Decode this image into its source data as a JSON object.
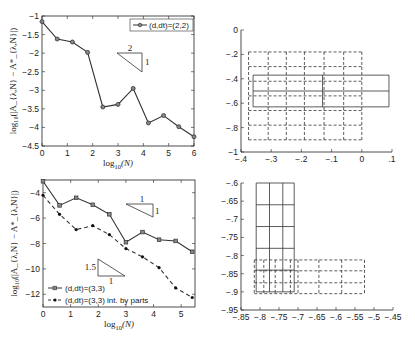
{
  "chart_data": [
    {
      "id": "top-left",
      "type": "line",
      "title": "",
      "xlabel": "log10(N)",
      "ylabel": "log10(|A_{λ,N} − A*_{λ,N}|)",
      "xlim": [
        0,
        6
      ],
      "ylim": [
        -4.5,
        -1
      ],
      "xticks": [
        0,
        1,
        2,
        3,
        4,
        5,
        6
      ],
      "yticks": [
        -1,
        -1.5,
        -2,
        -2.5,
        -3,
        -3.5,
        -4,
        -4.5
      ],
      "legend_position": "upper right",
      "series": [
        {
          "name": "(d,dt)=(2,2)",
          "style": "solid",
          "marker": "circle",
          "x": [
            0,
            0.6,
            1.2,
            1.8,
            2.4,
            3.0,
            3.6,
            4.2,
            4.8,
            5.4,
            6.0
          ],
          "y": [
            -1.15,
            -1.62,
            -1.7,
            -1.98,
            -3.45,
            -3.38,
            -2.95,
            -3.88,
            -3.68,
            -3.98,
            -4.25
          ]
        }
      ],
      "annotations": [
        {
          "type": "slope-triangle",
          "run_label": "2",
          "rise_label": "1"
        }
      ]
    },
    {
      "id": "bottom-left",
      "type": "line",
      "title": "",
      "xlabel": "log10(N)",
      "ylabel": "log10(|A_{λ,N} − A*_{λ,N}|)",
      "xlim": [
        0,
        5.5
      ],
      "ylim": [
        -13,
        -3
      ],
      "xticks": [
        0,
        1,
        2,
        3,
        4,
        5
      ],
      "yticks": [
        -4,
        -6,
        -8,
        -10,
        -12
      ],
      "legend_position": "lower left",
      "series": [
        {
          "name": "(d,dt)=(3,3)",
          "style": "solid",
          "marker": "square",
          "x": [
            0,
            0.6,
            1.2,
            1.8,
            2.4,
            3.0,
            3.6,
            4.2,
            4.8,
            5.4
          ],
          "y": [
            -3.1,
            -5.0,
            -4.4,
            -4.95,
            -5.7,
            -7.9,
            -7.1,
            -7.7,
            -7.8,
            -8.65
          ]
        },
        {
          "name": "(d,dt)=(3,3) int. by parts",
          "style": "dashed",
          "marker": "dot",
          "x": [
            0,
            0.6,
            1.2,
            1.8,
            2.4,
            3.0,
            3.6,
            4.2,
            4.8,
            5.4
          ],
          "y": [
            -4.2,
            -5.7,
            -6.9,
            -6.6,
            -7.3,
            -8.4,
            -9.05,
            -9.9,
            -11.5,
            -12.25
          ]
        }
      ],
      "annotations": [
        {
          "type": "slope-triangle",
          "run_label": "1",
          "rise_label": "1"
        },
        {
          "type": "slope-triangle",
          "run_label": "1",
          "rise_label": "1.5"
        }
      ]
    },
    {
      "id": "top-right",
      "type": "diagram-grid",
      "title": "",
      "xlim": [
        -0.4,
        0.1
      ],
      "ylim": [
        -1,
        0
      ],
      "xticks": [
        -0.4,
        -0.3,
        -0.2,
        -0.1,
        0,
        0.1
      ],
      "yticks": [
        0,
        -0.2,
        -0.4,
        -0.6,
        -0.8,
        -1
      ],
      "dashed_grid": {
        "x": [
          -0.375,
          -0.31,
          -0.25,
          -0.19,
          -0.125,
          -0.06,
          0.0
        ],
        "y": [
          -0.18,
          -0.3,
          -0.42,
          -0.54,
          -0.66,
          -0.78,
          -0.9
        ]
      },
      "solid_boxes": {
        "x": [
          -0.36,
          -0.13,
          0.09
        ],
        "y": [
          -0.37,
          -0.5,
          -0.63
        ]
      }
    },
    {
      "id": "bottom-right",
      "type": "diagram-grid",
      "title": "",
      "xlim": [
        -0.85,
        -0.45
      ],
      "ylim": [
        -0.95,
        -0.6
      ],
      "xticks": [
        -0.85,
        -0.8,
        -0.75,
        -0.7,
        -0.65,
        -0.6,
        -0.55,
        -0.5,
        -0.45
      ],
      "yticks": [
        -0.6,
        -0.65,
        -0.7,
        -0.75,
        -0.8,
        -0.85,
        -0.9,
        -0.95
      ],
      "solid_grid": {
        "x": [
          -0.81,
          -0.775,
          -0.74,
          -0.71
        ],
        "y": [
          -0.6,
          -0.66,
          -0.72,
          -0.78,
          -0.84,
          -0.9
        ]
      },
      "dashed_grid": {
        "x": [
          -0.815,
          -0.79,
          -0.76,
          -0.72,
          -0.7,
          -0.645,
          -0.585,
          -0.525
        ],
        "y": [
          -0.812,
          -0.842,
          -0.875,
          -0.905
        ]
      }
    }
  ],
  "labels": {
    "xlabel": "log",
    "xlabel_sub": "10",
    "xlabel_arg": "(N)",
    "ylabel_text": "log₁₀(|A_{λ,N} − A*_{λ,N}|)"
  }
}
